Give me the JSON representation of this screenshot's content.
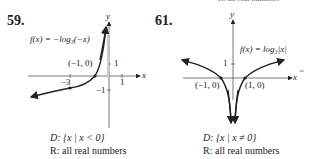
{
  "top_fragment": "R: all real numbers",
  "problems": [
    {
      "number": "59.",
      "function_label": "f(x) = −log₃(−x)",
      "point_label": "(−1, 0)",
      "ticks": {
        "x_neg": "−3",
        "x_pos": "1",
        "y_pos": "1",
        "y_neg": "−1"
      },
      "axis_x": "x",
      "axis_y": "y",
      "domain": "D: {x | x < 0}",
      "range": "R: all real numbers"
    },
    {
      "number": "61.",
      "function_label": "f(x) = log₃|x|",
      "point_left": "(−1, 0)",
      "point_right": "(1, 0)",
      "ticks": {
        "y_pos": "1"
      },
      "axis_x": "x",
      "axis_y": "y",
      "domain": "D: {x | x ≠ 0}",
      "range": "R: all real numbers"
    }
  ],
  "margin_mark": "="
}
